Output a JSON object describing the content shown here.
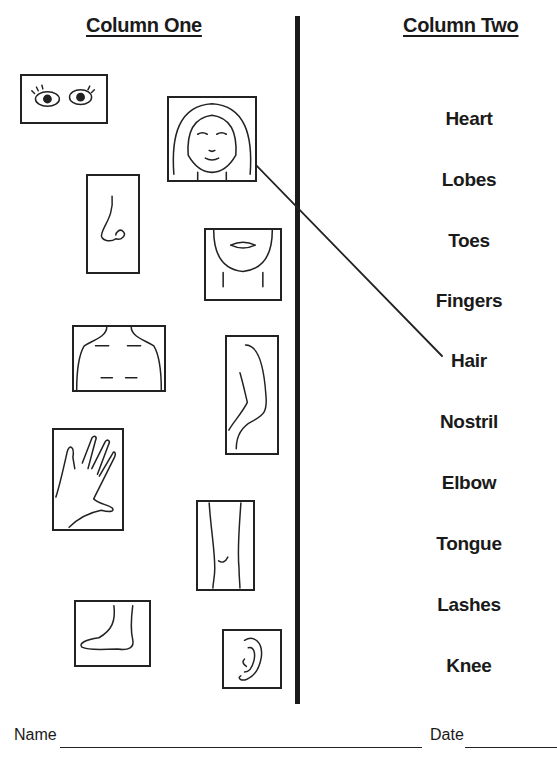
{
  "worksheet": {
    "column_one_title": "Column One",
    "column_two_title": "Column Two",
    "pictures": [
      {
        "name": "eyes"
      },
      {
        "name": "face"
      },
      {
        "name": "nose"
      },
      {
        "name": "chin"
      },
      {
        "name": "chest"
      },
      {
        "name": "arm"
      },
      {
        "name": "hand"
      },
      {
        "name": "knee"
      },
      {
        "name": "foot"
      },
      {
        "name": "ear"
      }
    ],
    "words": [
      "Heart",
      "Lobes",
      "Toes",
      "Fingers",
      "Hair",
      "Nostril",
      "Elbow",
      "Tongue",
      "Lashes",
      "Knee"
    ],
    "drawn_match": {
      "from": "face",
      "to": "Hair"
    },
    "footer": {
      "name_label": "Name",
      "date_label": "Date"
    }
  }
}
